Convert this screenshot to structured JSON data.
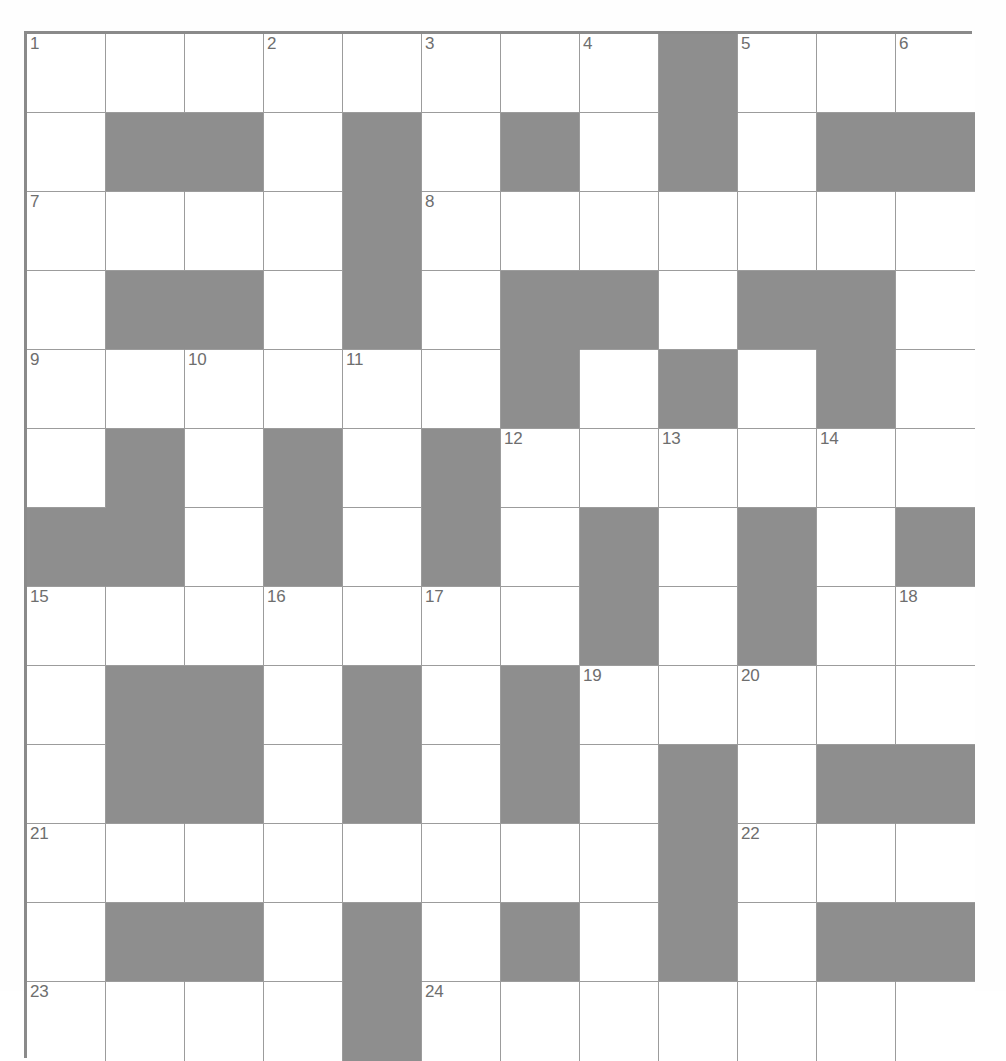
{
  "puzzle": {
    "title": "Crossword Grid",
    "type": "crossword",
    "columns": 12,
    "rows": 13,
    "cell_size": 79,
    "colors": {
      "block": "#8e8e8e",
      "cell": "#ffffff",
      "grid_line": "#9c9c9c",
      "outer_border": "#8a8a8a",
      "number": "#6e6e6e"
    },
    "legend": {
      "white_cell": "open letter square",
      "grey_cell": "blocked square"
    },
    "grid": [
      "0,0,0,0,0,0,0,0,1,0,0,0",
      "0,1,1,0,1,0,1,0,1,0,1,1",
      "0,0,0,0,1,0,0,0,0,0,0,0",
      "0,1,1,0,1,0,1,1,0,1,1,0",
      "0,0,0,0,0,0,1,0,1,0,1,0",
      "0,1,0,1,0,1,0,0,0,0,0,0",
      "1,1,0,1,0,1,0,1,0,1,0,1",
      "0,0,0,0,0,0,0,1,0,1,0,0",
      "0,1,1,0,1,0,1,0,0,0,0,0",
      "0,1,1,0,1,0,1,0,1,0,1,1",
      "0,0,0,0,0,0,0,0,1,0,0,0",
      "0,1,1,0,1,0,1,0,1,0,1,1",
      "0,0,0,0,1,0,0,0,0,0,0,0"
    ],
    "numbers": [
      {
        "n": "1",
        "row": 0,
        "col": 0
      },
      {
        "n": "2",
        "row": 0,
        "col": 3
      },
      {
        "n": "3",
        "row": 0,
        "col": 5
      },
      {
        "n": "4",
        "row": 0,
        "col": 7
      },
      {
        "n": "5",
        "row": 0,
        "col": 9
      },
      {
        "n": "6",
        "row": 0,
        "col": 11
      },
      {
        "n": "7",
        "row": 2,
        "col": 0
      },
      {
        "n": "8",
        "row": 2,
        "col": 5
      },
      {
        "n": "9",
        "row": 4,
        "col": 0
      },
      {
        "n": "10",
        "row": 4,
        "col": 2
      },
      {
        "n": "11",
        "row": 4,
        "col": 4
      },
      {
        "n": "12",
        "row": 5,
        "col": 6
      },
      {
        "n": "13",
        "row": 5,
        "col": 8
      },
      {
        "n": "14",
        "row": 5,
        "col": 10
      },
      {
        "n": "15",
        "row": 7,
        "col": 0
      },
      {
        "n": "16",
        "row": 7,
        "col": 3
      },
      {
        "n": "17",
        "row": 7,
        "col": 5
      },
      {
        "n": "18",
        "row": 7,
        "col": 11
      },
      {
        "n": "19",
        "row": 8,
        "col": 7
      },
      {
        "n": "20",
        "row": 8,
        "col": 9
      },
      {
        "n": "21",
        "row": 10,
        "col": 0
      },
      {
        "n": "22",
        "row": 10,
        "col": 9
      },
      {
        "n": "23",
        "row": 12,
        "col": 0
      },
      {
        "n": "24",
        "row": 12,
        "col": 5
      }
    ],
    "letters": []
  }
}
